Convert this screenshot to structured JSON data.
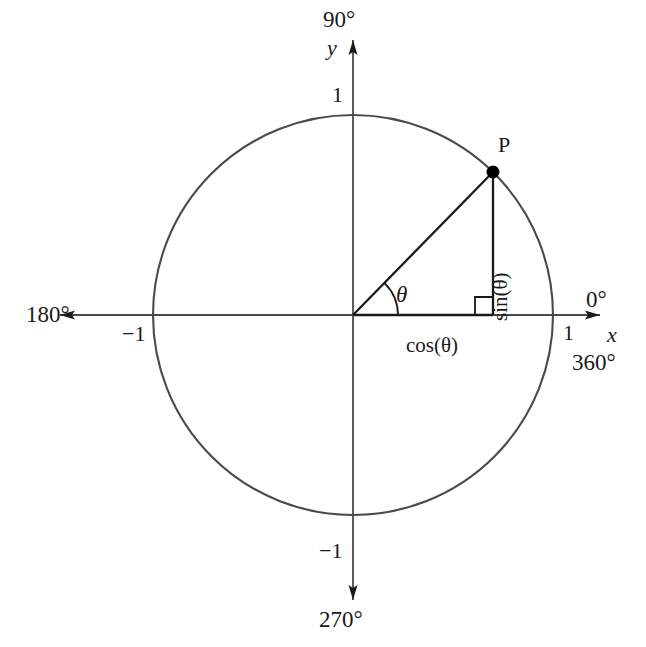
{
  "diagram": {
    "colors": {
      "circle_stroke": "#4a4a4a",
      "axis_stroke": "#4a4a4a",
      "triangle_stroke": "#1a1a1a",
      "text": "#1a1a1a",
      "point_fill": "#000000",
      "background": "#ffffff"
    },
    "geometry": {
      "center_x": 353,
      "center_y": 315,
      "radius": 200,
      "point_p_x": 493,
      "point_p_y": 172,
      "theta_degrees": 45.6,
      "arc_radius": 45,
      "right_angle_size": 18
    },
    "angle_labels": {
      "top": "90°",
      "left": "180°",
      "bottom": "270°",
      "right_zero": "0°",
      "right_full": "360°"
    },
    "axis_names": {
      "x": "x",
      "y": "y"
    },
    "tick_labels": {
      "y_positive": "1",
      "y_negative": "−1",
      "x_positive": "1",
      "x_negative": "−1"
    },
    "annotations": {
      "point": "P",
      "angle_symbol": "θ",
      "adjacent_side": "cos(θ)",
      "opposite_side": "sin(θ)"
    }
  }
}
